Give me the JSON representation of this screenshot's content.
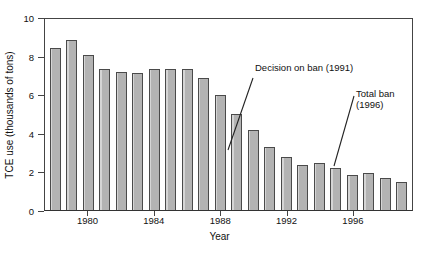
{
  "chart_data": {
    "type": "bar",
    "title": "",
    "xlabel": "Year",
    "ylabel": "TCE use (thousands of tons)",
    "categories": [
      1978,
      1979,
      1980,
      1981,
      1982,
      1983,
      1984,
      1985,
      1986,
      1987,
      1988,
      1989,
      1990,
      1991,
      1992,
      1993,
      1994,
      1995,
      1996,
      1997,
      1998,
      1999
    ],
    "values": [
      8.5,
      8.9,
      8.1,
      7.4,
      7.25,
      7.15,
      7.4,
      7.4,
      7.4,
      6.9,
      6.0,
      5.05,
      4.2,
      3.3,
      2.75,
      2.35,
      2.45,
      2.2,
      1.85,
      1.95,
      1.7,
      1.45
    ],
    "ylim": [
      0,
      10
    ],
    "yticks": [
      0,
      2,
      4,
      6,
      8,
      10
    ],
    "ytick_labels": [
      "0",
      "2",
      "4",
      "6",
      "8",
      "10"
    ],
    "xticks": [
      1980,
      1984,
      1988,
      1992,
      1996
    ],
    "xtick_labels": [
      "1980",
      "1984",
      "1988",
      "1992",
      "1996"
    ],
    "grid": false,
    "legend": null,
    "bar_color": "#b3b3b3",
    "bar_edge_color": "#4a4a4a",
    "axis_color": "#444444",
    "annotations": [
      {
        "id": "decision-on-ban",
        "lines": [
          "Decision on ban (1991)"
        ],
        "target_year": 1991,
        "target_value": 3.3
      },
      {
        "id": "total-ban",
        "lines": [
          "Total ban",
          "(1996)"
        ],
        "target_year": 1996,
        "target_value": 1.85
      }
    ]
  }
}
